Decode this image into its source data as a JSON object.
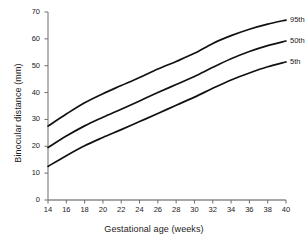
{
  "chart_data": {
    "type": "line",
    "title": "",
    "xlabel": "Gestational age (weeks)",
    "ylabel": "Binocular distance (mm)",
    "xlim": [
      14,
      40
    ],
    "ylim": [
      0,
      70
    ],
    "xticks": [
      14,
      16,
      18,
      20,
      22,
      24,
      26,
      28,
      30,
      32,
      34,
      36,
      38,
      40
    ],
    "yticks": [
      0,
      10,
      20,
      30,
      40,
      50,
      60,
      70
    ],
    "grid": false,
    "legend_position": "right-inline-labels",
    "x": [
      14,
      16,
      18,
      20,
      22,
      24,
      26,
      28,
      30,
      32,
      34,
      36,
      38,
      40
    ],
    "series": [
      {
        "name": "95th",
        "label": "95th",
        "color": "#111111",
        "values": [
          27.5,
          32.0,
          36.2,
          39.6,
          42.6,
          45.6,
          48.8,
          51.6,
          54.6,
          58.3,
          61.2,
          63.6,
          65.5,
          67.0
        ]
      },
      {
        "name": "50th",
        "label": "50th",
        "color": "#111111",
        "values": [
          19.5,
          23.8,
          27.6,
          30.8,
          33.8,
          36.9,
          40.0,
          43.0,
          46.0,
          49.4,
          52.6,
          55.3,
          57.5,
          59.2
        ]
      },
      {
        "name": "5th",
        "label": "5th",
        "color": "#111111",
        "values": [
          12.5,
          16.5,
          20.2,
          23.3,
          26.2,
          29.2,
          32.2,
          35.3,
          38.3,
          41.6,
          44.7,
          47.3,
          49.6,
          51.4
        ]
      }
    ]
  },
  "axis": {
    "x_title": "Gestational age (weeks)",
    "y_title": "Binocular distance (mm)",
    "x_tick_labels": [
      "14",
      "16",
      "18",
      "20",
      "22",
      "24",
      "26",
      "28",
      "30",
      "32",
      "34",
      "36",
      "38",
      "40"
    ],
    "y_tick_labels": [
      "0",
      "10",
      "20",
      "30",
      "40",
      "50",
      "60",
      "70"
    ]
  },
  "legend": {
    "items": [
      {
        "label": "95th"
      },
      {
        "label": "50th"
      },
      {
        "label": "5th"
      }
    ]
  }
}
